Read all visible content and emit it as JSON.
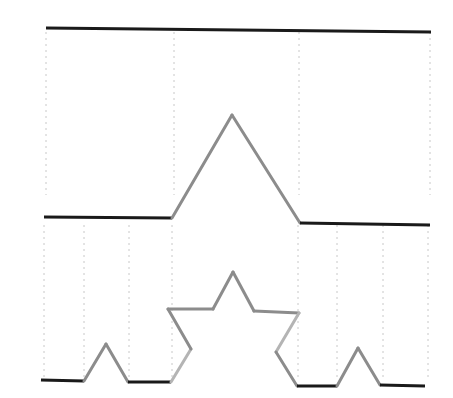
{
  "diagram": {
    "title": "",
    "colors": {
      "flat_segment": "#1a1a1a",
      "slanted_segment": "#8c8c8c",
      "slanted_segment_light": "#b4b4b4",
      "guide_line": "#c8c8c8",
      "background": "#ffffff"
    },
    "iterations": [
      {
        "level": 0,
        "points": [
          [
            46,
            28
          ],
          [
            431,
            32
          ]
        ],
        "guides_x": [
          46,
          174,
          299,
          430
        ],
        "guides_y_range": [
          32,
          195
        ]
      },
      {
        "level": 1,
        "points": [
          [
            44,
            217
          ],
          [
            172,
            218
          ],
          [
            232,
            115
          ],
          [
            300,
            223
          ],
          [
            430,
            225
          ]
        ],
        "guides_x": [
          44,
          84,
          129,
          172,
          298,
          337,
          383,
          428
        ],
        "guides_y_range": [
          225,
          380
        ]
      },
      {
        "level": 2,
        "points": [
          [
            41,
            380
          ],
          [
            84,
            381
          ],
          [
            106,
            344
          ],
          [
            128,
            382
          ],
          [
            171,
            382
          ],
          [
            191,
            349
          ],
          [
            168,
            309
          ],
          [
            213,
            309
          ],
          [
            233,
            272
          ],
          [
            254,
            311
          ],
          [
            299,
            313
          ],
          [
            276,
            352
          ],
          [
            297,
            386
          ],
          [
            337,
            386
          ],
          [
            358,
            348
          ],
          [
            380,
            385
          ],
          [
            425,
            386
          ]
        ]
      }
    ]
  }
}
